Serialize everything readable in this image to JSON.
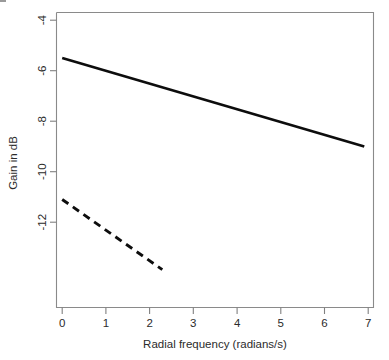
{
  "chart_data": {
    "type": "line",
    "title": "",
    "subtitle": "",
    "xlabel": "Radial frequency (radians/s)",
    "ylabel": "Gain in dB",
    "xlim": [
      -0.18,
      7.18
    ],
    "ylim": [
      -14.2,
      -3.55
    ],
    "xticks": [
      0,
      1,
      2,
      3,
      4,
      5,
      6,
      7
    ],
    "xticklabels": [
      "0",
      "1",
      "2",
      "3",
      "4",
      "5",
      "6",
      "7"
    ],
    "yticks": [
      -4,
      -6,
      -8,
      -10,
      -12
    ],
    "yticklabels": [
      "-4",
      "-6",
      "-8",
      "-10",
      "-12"
    ],
    "grid": false,
    "legend": null,
    "legend_position": "none",
    "annotations": [],
    "series": [
      {
        "name": "solid-line",
        "style": "solid",
        "color": "#0d0d0d",
        "x": [
          0.0,
          6.91
        ],
        "y": [
          -5.5,
          -9.0
        ]
      },
      {
        "name": "dashed-line",
        "style": "dashed",
        "color": "#0d0d0d",
        "x": [
          0.0,
          2.29
        ],
        "y": [
          -11.1,
          -13.88
        ]
      }
    ]
  },
  "axes": {
    "x_axis_name": "x-axis",
    "y_axis_name": "y-axis",
    "xlabel": "Radial frequency (radians/s)",
    "ylabel": "Gain in dB"
  },
  "ticklabels": {
    "x": [
      "0",
      "1",
      "2",
      "3",
      "4",
      "5",
      "6",
      "7"
    ],
    "y": [
      "-4",
      "-6",
      "-8",
      "-10",
      "-12"
    ]
  },
  "colors": {
    "background": "#ffffff",
    "axis": "#808080",
    "box": "#8a8a8a",
    "text": "#2b2b2b",
    "series": "#0d0d0d"
  }
}
